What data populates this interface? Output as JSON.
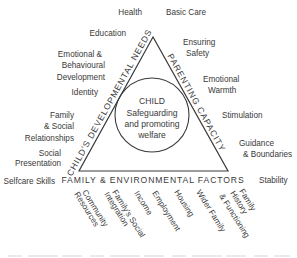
{
  "diagram": {
    "type": "assessment-triangle",
    "colors": {
      "line": "#3a3a3a",
      "text": "#3a3a3a",
      "background": "#ffffff"
    },
    "center": {
      "title": "CHILD",
      "lines": [
        "Safeguarding",
        "and promoting",
        "welfare"
      ]
    },
    "sides": {
      "left": "CHILD'S DEVELOPMENTAL NEEDS",
      "right": "PARENTING CAPACITY",
      "bottom": "FAMILY & ENVIRONMENTAL FACTORS"
    },
    "developmental_needs": [
      {
        "lines": [
          "Health"
        ]
      },
      {
        "lines": [
          "Education"
        ]
      },
      {
        "lines": [
          "Emotional &",
          "Behavioural",
          "Development"
        ]
      },
      {
        "lines": [
          "Identity"
        ]
      },
      {
        "lines": [
          "Family",
          "& Social",
          "Relationships"
        ]
      },
      {
        "lines": [
          "Social",
          "Presentation"
        ]
      },
      {
        "lines": [
          "Selfcare Skills"
        ]
      }
    ],
    "parenting_capacity": [
      {
        "lines": [
          "Basic Care"
        ]
      },
      {
        "lines": [
          "Ensuring",
          "Safety"
        ]
      },
      {
        "lines": [
          "Emotional",
          "Warmth"
        ]
      },
      {
        "lines": [
          "Stimulation"
        ]
      },
      {
        "lines": [
          "Guidance",
          "& Boundaries"
        ]
      },
      {
        "lines": [
          "Stability"
        ]
      }
    ],
    "family_factors": [
      {
        "lines": [
          "Community",
          "Resources"
        ]
      },
      {
        "lines": [
          "Family's Social",
          "Integration"
        ]
      },
      {
        "lines": [
          "Income"
        ]
      },
      {
        "lines": [
          "Employment"
        ]
      },
      {
        "lines": [
          "Housing"
        ]
      },
      {
        "lines": [
          "Wider Family"
        ]
      },
      {
        "lines": [
          "Family",
          "History",
          "& Functioning"
        ]
      }
    ]
  }
}
